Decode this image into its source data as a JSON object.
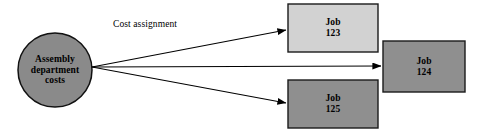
{
  "diagram": {
    "background_color": "#ffffff",
    "stroke_color": "#000000",
    "source": {
      "id": "assembly-department-costs",
      "shape": "circle",
      "line1": "Assembly",
      "line2": "department",
      "line3": "costs",
      "fill_color": "#8a8a8a",
      "cx": 55,
      "cy": 70,
      "r": 37
    },
    "edges": [
      {
        "id": "edge-to-job-123",
        "label": "Cost assignment",
        "from": "assembly-department-costs",
        "to": "job-123",
        "x1": 92,
        "y1": 67,
        "x2": 286,
        "y2": 30
      },
      {
        "id": "edge-to-job-124",
        "label": "",
        "from": "assembly-department-costs",
        "to": "job-124",
        "x1": 92,
        "y1": 67,
        "x2": 381,
        "y2": 66
      },
      {
        "id": "edge-to-job-125",
        "label": "",
        "from": "assembly-department-costs",
        "to": "job-125",
        "x1": 92,
        "y1": 67,
        "x2": 286,
        "y2": 103
      }
    ],
    "edge_label": {
      "text": "Cost assignment",
      "x": 113,
      "y": 27
    },
    "nodes": [
      {
        "id": "job-123",
        "shape": "rect",
        "line1": "Job",
        "line2": "123",
        "fill_color": "#d2d2d2",
        "x": 288,
        "y": 4,
        "w": 90,
        "h": 48
      },
      {
        "id": "job-124",
        "shape": "rect",
        "line1": "Job",
        "line2": "124",
        "fill_color": "#8f8f8f",
        "x": 383,
        "y": 41,
        "w": 82,
        "h": 51
      },
      {
        "id": "job-125",
        "shape": "rect",
        "line1": "Job",
        "line2": "125",
        "fill_color": "#8f8f8f",
        "x": 288,
        "y": 80,
        "w": 90,
        "h": 48
      }
    ]
  }
}
